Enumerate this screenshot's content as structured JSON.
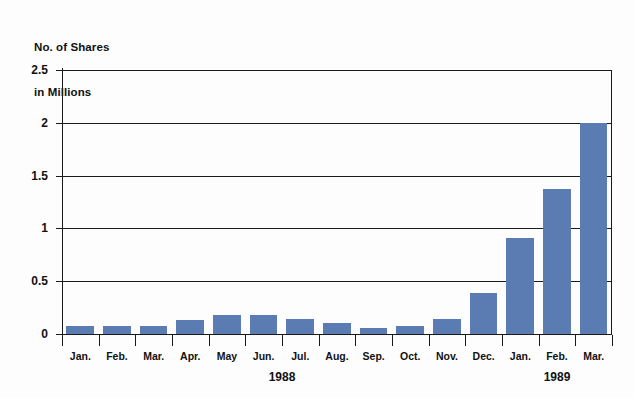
{
  "title": {
    "line1": "No. of Shares",
    "line2": "in Millions"
  },
  "colors": {
    "bar": "#5a7cb2",
    "axis": "#1a1a1a",
    "background": "#fdfdfd"
  },
  "chart_data": {
    "type": "bar",
    "title": "No. of Shares in Millions",
    "xlabel": "",
    "ylabel": "No. of Shares in Millions",
    "ylim": [
      0,
      2.5
    ],
    "grid": true,
    "legend": false,
    "y_ticks": [
      "0",
      "0.5",
      "1",
      "1.5",
      "2",
      "2.5"
    ],
    "y_tick_values": [
      0,
      0.5,
      1,
      1.5,
      2,
      2.5
    ],
    "categories": [
      "Jan.",
      "Feb.",
      "Mar.",
      "Apr.",
      "May",
      "Jun.",
      "Jul.",
      "Aug.",
      "Sep.",
      "Oct.",
      "Nov.",
      "Dec.",
      "Jan.",
      "Feb.",
      "Mar."
    ],
    "values": [
      0.08,
      0.08,
      0.08,
      0.13,
      0.18,
      0.18,
      0.14,
      0.1,
      0.06,
      0.08,
      0.14,
      0.39,
      0.91,
      1.37,
      2.0
    ],
    "group_labels": [
      {
        "label": "1988",
        "start_index": 0,
        "end_index": 11
      },
      {
        "label": "1989",
        "start_index": 12,
        "end_index": 14
      }
    ]
  }
}
